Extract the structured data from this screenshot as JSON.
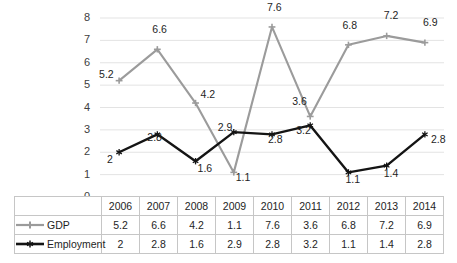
{
  "chart_data": {
    "type": "line",
    "title": "",
    "subtitle": "",
    "xlabel": "",
    "ylabel": "",
    "categories": [
      "2006",
      "2007",
      "2008",
      "2009",
      "2010",
      "2011",
      "2012",
      "2013",
      "2014"
    ],
    "series": [
      {
        "name": "GDP",
        "color": "#9b9b9b",
        "marker": "diamond-plus",
        "values": [
          5.2,
          6.6,
          4.2,
          1.1,
          7.6,
          3.6,
          6.8,
          7.2,
          6.9
        ],
        "labels": [
          "5.2",
          "6.6",
          "4.2",
          "1.1",
          "7.6",
          "3.6",
          "6.8",
          "7.2",
          "6.9"
        ]
      },
      {
        "name": "Employment",
        "color": "#141414",
        "marker": "asterisk",
        "values": [
          2,
          2.8,
          1.6,
          2.9,
          2.8,
          3.2,
          1.1,
          1.4,
          2.8
        ],
        "labels": [
          "2",
          "2.8",
          "1.6",
          "2.9",
          "2.8",
          "3.2",
          "1.1",
          "1.4",
          "2.8"
        ]
      }
    ],
    "ylim": [
      0,
      8
    ],
    "yticks": [
      0,
      1,
      2,
      3,
      4,
      5,
      6,
      7,
      8
    ],
    "ytick_labels": [
      "0",
      "1",
      "2",
      "3",
      "4",
      "5",
      "6",
      "7",
      "8"
    ],
    "grid": "horizontal",
    "grid_color": "#e3e3e3",
    "legend_position": "data-table-left",
    "data_table_visible": true
  },
  "table": {
    "corner_label": "",
    "header": [
      "2006",
      "2007",
      "2008",
      "2009",
      "2010",
      "2011",
      "2012",
      "2013",
      "2014"
    ],
    "rows": [
      {
        "name": "GDP",
        "values": [
          "5.2",
          "6.6",
          "4.2",
          "1.1",
          "7.6",
          "3.6",
          "6.8",
          "7.2",
          "6.9"
        ]
      },
      {
        "name": "Employment",
        "values": [
          "2",
          "2.8",
          "1.6",
          "2.9",
          "2.8",
          "3.2",
          "1.1",
          "1.4",
          "2.8"
        ]
      }
    ]
  }
}
